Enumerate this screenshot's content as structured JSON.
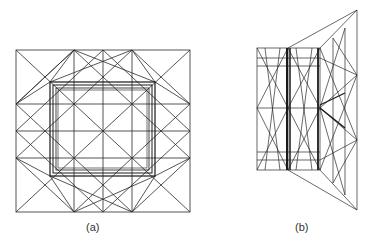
{
  "figures": [
    {
      "id": "a",
      "caption": "(a)",
      "description": "Square truss lattice, top view, 3x3 grid with diagonals and inner square frame"
    },
    {
      "id": "b",
      "caption": "(b)",
      "description": "Truss lattice, perspective side view with trapezoidal face"
    }
  ],
  "colors": {
    "line": "#2a2a2a",
    "heavy": "#1a1a1a",
    "background": "#ffffff"
  }
}
